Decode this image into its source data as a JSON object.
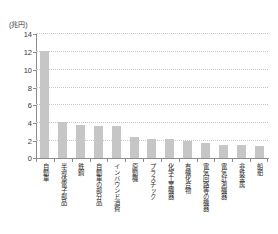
{
  "chart_data": {
    "type": "bar",
    "title": "",
    "subtitle": "",
    "xlabel": "",
    "ylabel": "",
    "unit_label": "(兆円)",
    "ylim": [
      0,
      14
    ],
    "yticks": [
      0,
      2,
      4,
      6,
      8,
      10,
      12,
      14
    ],
    "ytick_labels": [
      "0",
      "2",
      "4",
      "6",
      "8",
      "10",
      "12",
      "14"
    ],
    "grid": true,
    "grid_style": "dotted-horizontal",
    "legend": null,
    "legend_position": "none",
    "bar_color": "#c6c6c6",
    "axis_color": "#8d8d8d",
    "categories": [
      "自動車",
      "半導体電子部品",
      "鉄鋼",
      "自動車の部分品",
      "インバウンド消費",
      "原動機",
      "プラスチック",
      "化学工業機器",
      "有機化合物",
      "電気回路等の機器",
      "電気計測機器",
      "非鉄金属",
      "船舶"
    ],
    "values": [
      12.0,
      4.0,
      3.7,
      3.6,
      3.6,
      2.3,
      2.1,
      2.1,
      1.9,
      1.7,
      1.5,
      1.5,
      1.3
    ]
  }
}
